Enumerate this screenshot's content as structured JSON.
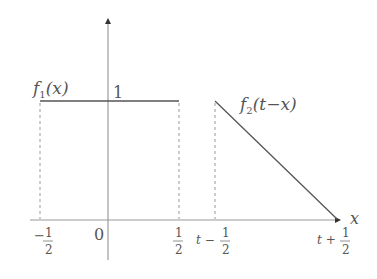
{
  "diagram": {
    "type": "convolution-sketch",
    "axes": {
      "x_label": "x",
      "origin_label": "0"
    },
    "functions": [
      {
        "name": "f1",
        "label_main": "f",
        "label_sub": "1",
        "label_arg": "(x)",
        "shape": "rectangular pulse",
        "height_label": "1",
        "left_tick": {
          "sign": "−",
          "num": "1",
          "den": "2"
        },
        "right_tick": {
          "sign": "",
          "num": "1",
          "den": "2"
        }
      },
      {
        "name": "f2",
        "label_main": "f",
        "label_sub": "2",
        "label_arg": "(t−x)",
        "shape": "descending ramp",
        "left_tick": {
          "prefix": "t −",
          "num": "1",
          "den": "2"
        },
        "right_tick": {
          "prefix": "t +",
          "num": "1",
          "den": "2"
        }
      }
    ],
    "colors": {
      "line": "#555555",
      "axis": "#888888",
      "dashed": "#999999",
      "text": "#555555"
    }
  }
}
